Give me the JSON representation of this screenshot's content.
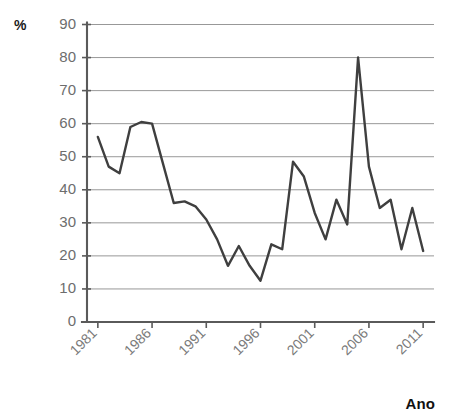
{
  "axes": {
    "y_unit_label": "%",
    "x_title": "Ano"
  },
  "chart_data": {
    "type": "line",
    "title": "",
    "subtitle": "",
    "xlabel": "Ano",
    "ylabel": "%",
    "xlim": [
      1980,
      2012
    ],
    "ylim": [
      0,
      90
    ],
    "grid": true,
    "legend": false,
    "legend_position": "none",
    "line_color": "#3f3f3f",
    "grid_color": "#8c8c8c",
    "axis_color": "#5a5a5a",
    "ytick_labels": [
      "0",
      "10",
      "20",
      "30",
      "40",
      "50",
      "60",
      "70",
      "80",
      "90"
    ],
    "yticks": [
      0,
      10,
      20,
      30,
      40,
      50,
      60,
      70,
      80,
      90
    ],
    "xtick_labels": [
      "1981",
      "1986",
      "1991",
      "1996",
      "2001",
      "2006",
      "2011"
    ],
    "xticks": [
      1981,
      1986,
      1991,
      1996,
      2001,
      2006,
      2011
    ],
    "x": [
      1981,
      1982,
      1983,
      1984,
      1985,
      1986,
      1987,
      1988,
      1989,
      1990,
      1991,
      1992,
      1993,
      1994,
      1995,
      1996,
      1997,
      1998,
      1999,
      2000,
      2001,
      2002,
      2003,
      2004,
      2005,
      2006,
      2007,
      2008,
      2009,
      2010,
      2011
    ],
    "values": [
      56,
      47,
      45,
      59,
      60.5,
      60,
      48,
      36,
      36.5,
      35,
      31,
      25,
      17,
      23,
      17,
      12.5,
      23.5,
      22,
      48.5,
      44,
      33,
      25,
      37,
      29.5,
      80,
      47,
      34.5,
      37,
      22,
      34.5,
      21.5
    ],
    "series": [
      {
        "name": "%",
        "values": [
          56,
          47,
          45,
          59,
          60.5,
          60,
          48,
          36,
          36.5,
          35,
          31,
          25,
          17,
          23,
          17,
          12.5,
          23.5,
          22,
          48.5,
          44,
          33,
          25,
          37,
          29.5,
          80,
          47,
          34.5,
          37,
          22,
          34.5,
          21.5
        ]
      }
    ],
    "annotations": []
  }
}
